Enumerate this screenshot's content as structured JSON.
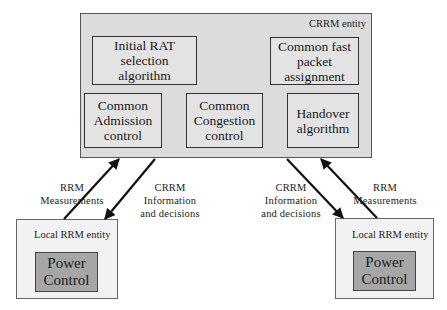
{
  "crrm_entity": {
    "label": "CRRM entity",
    "modules": {
      "initial_rat": "Initial RAT\nselection\nalgorithm",
      "fast_packet": "Common fast\npacket\nassignment",
      "admission": "Common\nAdmission\ncontrol",
      "congestion": "Common\nCongestion\ncontrol",
      "handover": "Handover\nalgorithm"
    }
  },
  "local_entities": [
    {
      "label": "Local RRM entity",
      "module": "Power\nControl"
    },
    {
      "label": "Local RRM entity",
      "module": "Power\nControl"
    }
  ],
  "links": {
    "left_measurements": "RRM\nMeasurements",
    "left_decisions": "CRRM\nInformation\nand decisions",
    "right_decisions": "CRRM\nInformation\nand decisions",
    "right_measurements": "RRM\nMeasurements"
  }
}
